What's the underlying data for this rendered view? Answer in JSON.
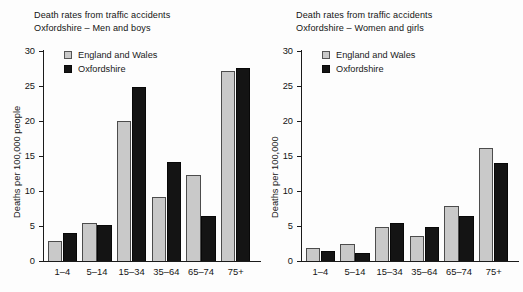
{
  "figure": {
    "background": "#fdfdfd",
    "series_colors": {
      "england_and_wales": "#c9c9c9",
      "oxfordshire": "#141414"
    }
  },
  "panels": [
    {
      "id": "men-and-boys",
      "title_line1": "Death rates from traffic accidents",
      "title_line2": "Oxfordshire – Men and boys",
      "ylabel": "Deaths per 100,000 people",
      "legend": [
        {
          "label": "England and Wales",
          "swatch": "light"
        },
        {
          "label": "Oxfordshire",
          "swatch": "dark"
        }
      ],
      "yticks": [
        "0",
        "5",
        "10",
        "15",
        "20",
        "25",
        "30"
      ],
      "xticks": [
        "1–4",
        "5–14",
        "15–34",
        "35–64",
        "65–74",
        "75+"
      ]
    },
    {
      "id": "women-and-girls",
      "title_line1": "Death rates from traffic accidents",
      "title_line2": "Oxfordshire – Women and girls",
      "ylabel": "Deaths per 100,000",
      "legend": [
        {
          "label": "England and Wales",
          "swatch": "light"
        },
        {
          "label": "Oxfordshire",
          "swatch": "dark"
        }
      ],
      "yticks": [
        "0",
        "5",
        "10",
        "15",
        "20",
        "25",
        "30"
      ],
      "xticks": [
        "1–4",
        "5–14",
        "15–34",
        "35–64",
        "65–74",
        "75+"
      ]
    }
  ],
  "chart_data": [
    {
      "type": "bar",
      "title": "Death rates from traffic accidents Oxfordshire – Men and boys",
      "xlabel": "",
      "ylabel": "Deaths per 100,000 people",
      "ylim": [
        0,
        30
      ],
      "yticks": [
        0,
        5,
        10,
        15,
        20,
        25,
        30
      ],
      "grid": false,
      "legend_position": "top-left",
      "categories": [
        "1–4",
        "5–14",
        "15–34",
        "35–64",
        "65–74",
        "75+"
      ],
      "series": [
        {
          "name": "England and Wales",
          "color": "#c9c9c9",
          "values": [
            2.9,
            5.5,
            20.0,
            9.2,
            12.3,
            27.2
          ]
        },
        {
          "name": "Oxfordshire",
          "color": "#141414",
          "values": [
            4.0,
            5.2,
            24.8,
            14.1,
            6.5,
            27.6
          ]
        }
      ]
    },
    {
      "type": "bar",
      "title": "Death rates from traffic accidents Oxfordshire – Women and girls",
      "xlabel": "",
      "ylabel": "Deaths per 100,000",
      "ylim": [
        0,
        30
      ],
      "yticks": [
        0,
        5,
        10,
        15,
        20,
        25,
        30
      ],
      "grid": false,
      "legend_position": "top-left",
      "categories": [
        "1–4",
        "5–14",
        "15–34",
        "35–64",
        "65–74",
        "75+"
      ],
      "series": [
        {
          "name": "England and Wales",
          "color": "#c9c9c9",
          "values": [
            1.8,
            2.5,
            4.8,
            3.6,
            7.8,
            16.2
          ]
        },
        {
          "name": "Oxfordshire",
          "color": "#141414",
          "values": [
            1.5,
            1.2,
            5.5,
            4.9,
            6.5,
            14.0
          ]
        }
      ]
    }
  ]
}
